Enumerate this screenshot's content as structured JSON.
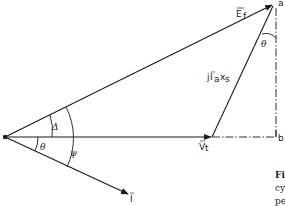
{
  "diagram": {
    "type": "phasor-diagram",
    "colors": {
      "ink": "#1a1a1a",
      "background": "#ffffff"
    },
    "phasors": [
      {
        "id": "E_f",
        "label": "E",
        "subscript": "f",
        "overbar": true
      },
      {
        "id": "V_t",
        "label": "V",
        "subscript": "t",
        "overbar": true
      },
      {
        "id": "I",
        "label": "I",
        "overbar": true
      },
      {
        "id": "jIaxs",
        "label_prefix": "j",
        "label_main": "I",
        "label_sub1": "a",
        "label_mid": "x",
        "label_sub2": "s",
        "overbar_on": "I"
      }
    ],
    "points": {
      "a": "a",
      "b": "b"
    },
    "angles": {
      "delta": "Δ",
      "theta_lower": "θ",
      "psi": "ψ",
      "theta_upper": "θ"
    },
    "caption_fragments": [
      "Fi",
      "cy",
      "pe"
    ]
  }
}
